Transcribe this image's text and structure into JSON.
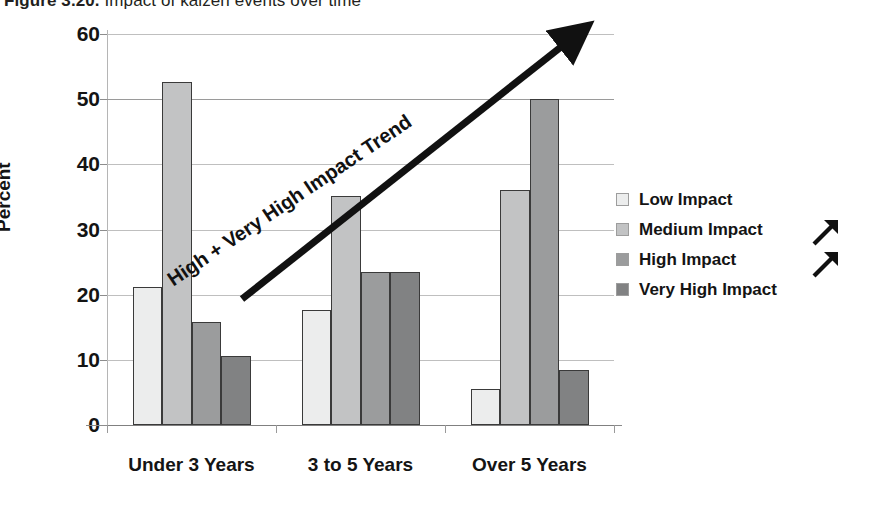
{
  "title": {
    "number": "Figure 3.20.",
    "caption": " Impact of kaizen events over time"
  },
  "chart_data": {
    "type": "bar",
    "title": "Figure 3.20. Impact of kaizen events over time",
    "xlabel": "",
    "ylabel": "Percent",
    "ylim": [
      0,
      60
    ],
    "ytick_step": 10,
    "yticks": [
      "60",
      "50",
      "40",
      "30",
      "20",
      "10",
      "0"
    ],
    "grid": true,
    "legend_position": "right",
    "categories": [
      "Under 3 Years",
      "3 to 5 Years",
      "Over 5 Years"
    ],
    "series": [
      {
        "name": "Low Impact",
        "color": "#eceded",
        "values": [
          21.2,
          17.6,
          5.6
        ]
      },
      {
        "name": "Medium Impact",
        "color": "#c2c3c4",
        "values": [
          52.7,
          35.2,
          36.1
        ]
      },
      {
        "name": "High Impact",
        "color": "#9b9c9d",
        "values": [
          15.8,
          23.5,
          50.0
        ]
      },
      {
        "name": "Very High Impact",
        "color": "#818283",
        "values": [
          10.6,
          23.5,
          8.5
        ]
      }
    ],
    "annotations": [
      {
        "name": "trend-arrow",
        "text": "High + Very High Impact Trend",
        "type": "arrow",
        "direction": "up-right"
      }
    ]
  },
  "legend": {
    "items": [
      {
        "label": "Low Impact",
        "swatch": "#eceded"
      },
      {
        "label": "Medium Impact",
        "swatch": "#c2c3c4"
      },
      {
        "label": "High Impact",
        "swatch": "#9b9c9d"
      },
      {
        "label": "Very High Impact",
        "swatch": "#818283"
      }
    ]
  },
  "trend": {
    "label": "High + Very High Impact Trend"
  },
  "icons": {
    "corner_arrow_1": "arrow-up-right-icon",
    "corner_arrow_2": "arrow-up-right-icon"
  }
}
